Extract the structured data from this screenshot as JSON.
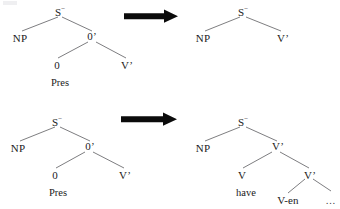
{
  "figure": {
    "type": "syntax-tree-transformation-rules",
    "background_color": "#ffffff",
    "line_color": "#6e6e72",
    "text_color": "#1a1a1a",
    "arrow_color": "#0b0b0b",
    "rows": [
      {
        "id": "rule-1",
        "arrow": "rightwards-arrow",
        "input_tree": {
          "root": {
            "label": "S",
            "superscript": "−"
          },
          "children": [
            {
              "label": "NP"
            },
            {
              "label": "0’",
              "children": [
                {
                  "label": "0",
                  "terminal": "Pres"
                },
                {
                  "label": "V’"
                }
              ]
            }
          ]
        },
        "output_tree": {
          "root": {
            "label": "S",
            "superscript": "−"
          },
          "children": [
            {
              "label": "NP"
            },
            {
              "label": "V’"
            }
          ]
        }
      },
      {
        "id": "rule-2",
        "arrow": "rightwards-arrow",
        "input_tree": {
          "root": {
            "label": "S",
            "superscript": "−"
          },
          "children": [
            {
              "label": "NP"
            },
            {
              "label": "0’",
              "children": [
                {
                  "label": "0",
                  "terminal": "Pres"
                },
                {
                  "label": "V’"
                }
              ]
            }
          ]
        },
        "output_tree": {
          "root": {
            "label": "S",
            "superscript": "−"
          },
          "children": [
            {
              "label": "NP"
            },
            {
              "label": "V’",
              "children": [
                {
                  "label": "V",
                  "terminal": "have"
                },
                {
                  "label": "V’",
                  "children": [
                    {
                      "label": "V-en"
                    },
                    {
                      "label": "…"
                    }
                  ]
                }
              ]
            }
          ]
        }
      }
    ]
  },
  "labels": {
    "r1_in_root": "S",
    "r1_in_root_sup": "−",
    "r1_in_np": "NP",
    "r1_in_obar": "0’",
    "r1_in_zero": "0",
    "r1_in_pres": "Pres",
    "r1_in_vbar": "V’",
    "r1_out_root": "S",
    "r1_out_root_sup": "−",
    "r1_out_np": "NP",
    "r1_out_vbar": "V’",
    "r2_in_root": "S",
    "r2_in_root_sup": "−",
    "r2_in_np": "NP",
    "r2_in_obar": "0’",
    "r2_in_zero": "0",
    "r2_in_pres": "Pres",
    "r2_in_vbar": "V’",
    "r2_out_root": "S",
    "r2_out_root_sup": "−",
    "r2_out_np": "NP",
    "r2_out_vbar1": "V’",
    "r2_out_v": "V",
    "r2_out_have": "have",
    "r2_out_vbar2": "V’",
    "r2_out_ven": "V-en",
    "r2_out_ellipsis": "…"
  }
}
